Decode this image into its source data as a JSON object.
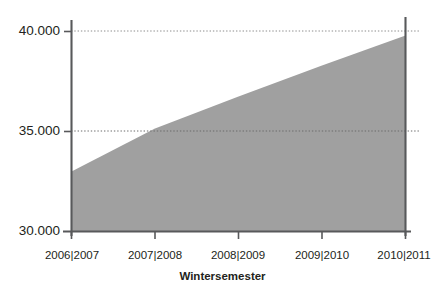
{
  "chart_data": {
    "type": "area",
    "title": "",
    "xlabel": "Wintersemester",
    "ylabel": "",
    "categories": [
      "2006|2007",
      "2007|2008",
      "2008|2009",
      "2009|2010",
      "2010|2011"
    ],
    "values": [
      33000,
      35150,
      36750,
      38300,
      39800
    ],
    "ylim": [
      30000,
      40000
    ],
    "yticks": [
      30000,
      35000,
      40000
    ],
    "ytick_labels": [
      "30.000",
      "35.000",
      "40.000"
    ],
    "grid": true,
    "grid_style": "dotted-horizontal",
    "legend": "none",
    "series": [
      {
        "name": "Studierende",
        "values": [
          33000,
          35150,
          36750,
          38300,
          39800
        ],
        "fill_color": "#a0a0a0"
      }
    ],
    "colors": {
      "area_fill": "#a0a0a0",
      "axis": "#58595b",
      "grid": "#8c8c8c",
      "text": "#231f20",
      "background": "#ffffff"
    }
  },
  "axes": {
    "y": {
      "ticks": [
        {
          "label": "40.000",
          "value": 40000
        },
        {
          "label": "35.000",
          "value": 35000
        },
        {
          "label": "30.000",
          "value": 30000
        }
      ]
    },
    "x": {
      "title": "Wintersemester",
      "ticks": [
        {
          "label": "2006|2007"
        },
        {
          "label": "2007|2008"
        },
        {
          "label": "2008|2009"
        },
        {
          "label": "2009|2010"
        },
        {
          "label": "2010|2011"
        }
      ]
    }
  }
}
